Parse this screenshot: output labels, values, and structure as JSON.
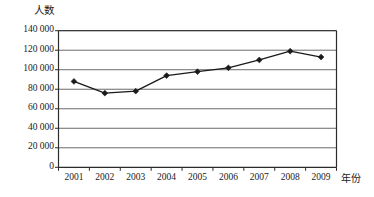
{
  "chart_data": {
    "type": "line",
    "title": "",
    "subtitle": "",
    "xlabel": "年份",
    "ylabel": "人数",
    "categories": [
      "2001",
      "2002",
      "2003",
      "2004",
      "2005",
      "2006",
      "2007",
      "2008",
      "2009"
    ],
    "values": [
      88000,
      76000,
      78000,
      94000,
      98000,
      102000,
      110000,
      119000,
      113000
    ],
    "series": [
      {
        "name": "人数",
        "values": [
          88000,
          76000,
          78000,
          94000,
          98000,
          102000,
          110000,
          119000,
          113000
        ]
      }
    ],
    "ylim": [
      0,
      140000
    ],
    "y_ticks": [
      0,
      20000,
      40000,
      60000,
      80000,
      100000,
      120000,
      140000
    ],
    "y_tick_labels": [
      "0",
      "20 000",
      "40 000",
      "60 000",
      "80 000",
      "100 000",
      "120 000",
      "140 000"
    ],
    "x_tick_labels": [
      "2001",
      "2002",
      "2003",
      "2004",
      "2005",
      "2006",
      "2007",
      "2008",
      "2009"
    ],
    "grid": true,
    "grid_axis": "y",
    "legend": false,
    "legend_position": "none",
    "marker": "diamond",
    "line_color": "#1a1a1a",
    "marker_color": "#1a1a1a",
    "grid_color": "#5a5a5a",
    "axis_color": "#2b2b2b",
    "annotations": []
  }
}
